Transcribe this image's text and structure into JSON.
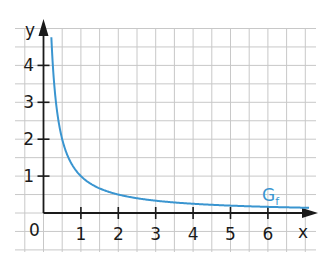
{
  "chart_data": {
    "type": "line",
    "title": "",
    "xlabel": "x",
    "ylabel": "y",
    "function": "f(x) = 1/x",
    "series": [
      {
        "name": "G_f",
        "label_main": "G",
        "label_sub": "f",
        "color": "#3a95d0",
        "x": [
          0.21,
          0.25,
          0.3,
          0.4,
          0.5,
          0.75,
          1,
          1.5,
          2,
          2.5,
          3,
          4,
          5,
          6,
          7.1
        ],
        "y": [
          4.76,
          4.0,
          3.33,
          2.5,
          2.0,
          1.33,
          1.0,
          0.67,
          0.5,
          0.4,
          0.33,
          0.25,
          0.2,
          0.17,
          0.14
        ]
      }
    ],
    "x_ticks": [
      "1",
      "2",
      "3",
      "4",
      "5",
      "6"
    ],
    "y_ticks": [
      "1",
      "2",
      "3",
      "4"
    ],
    "origin_label": "0",
    "xlim": [
      -0.75,
      7.3
    ],
    "ylim": [
      -1,
      5.1
    ],
    "grid": true,
    "grid_step": 0.5,
    "legend": "none"
  },
  "colors": {
    "curve": "#3a95d0",
    "axis": "#1a1a1a",
    "grid": "#c8c8c8"
  }
}
